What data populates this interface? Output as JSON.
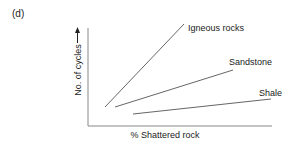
{
  "panel_label": "(d)",
  "axes": {
    "xlabel": "% Shattered rock",
    "ylabel": "No. of cycles"
  },
  "colors": {
    "axis": "#888888",
    "line": "#666666",
    "text": "#222222"
  },
  "series": [
    {
      "name": "Igneous rocks",
      "x1": 105,
      "y1": 107,
      "x2": 184,
      "y2": 24,
      "label_x": 188,
      "label_y": 31
    },
    {
      "name": "Sandstone",
      "x1": 115,
      "y1": 107,
      "x2": 233,
      "y2": 70,
      "label_x": 229,
      "label_y": 65
    },
    {
      "name": "Shale",
      "x1": 133,
      "y1": 114,
      "x2": 271,
      "y2": 99,
      "label_x": 259,
      "label_y": 96
    }
  ]
}
